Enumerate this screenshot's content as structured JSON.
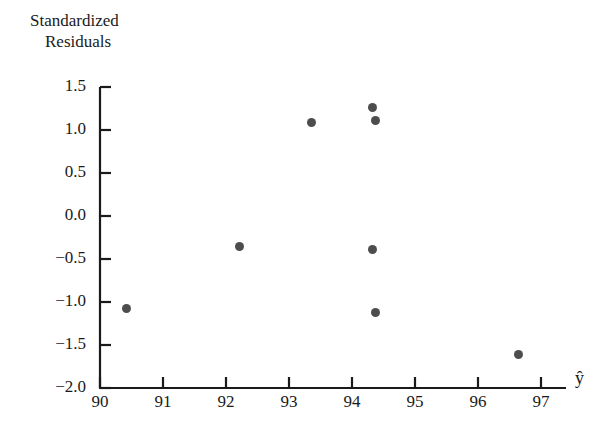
{
  "axis_titles": {
    "y_line1": "Standardized",
    "y_line2": "Residuals",
    "x_label": "ŷ"
  },
  "colors": {
    "marker": "#4d4d4d",
    "axis": "#1a1a1a",
    "text": "#1a1a1a",
    "background": "#ffffff"
  },
  "chart_data": {
    "type": "scatter",
    "title": "",
    "xlabel": "ŷ",
    "ylabel": "Standardized Residuals",
    "xlim": [
      90,
      97.7
    ],
    "ylim": [
      -2.0,
      1.5
    ],
    "grid": false,
    "legend": "none",
    "xticks": [
      90,
      91,
      92,
      93,
      94,
      95,
      96,
      97
    ],
    "xtick_labels": [
      "90",
      "91",
      "92",
      "93",
      "94",
      "95",
      "96",
      "97"
    ],
    "yticks": [
      1.5,
      1.0,
      0.5,
      0.0,
      -0.5,
      -1.0,
      -1.5,
      -2.0
    ],
    "ytick_labels": [
      "1.5",
      "1.0",
      "0.5",
      "0.0",
      "−0.5",
      "−1.0",
      "−1.5",
      "−2.0"
    ],
    "marker_size": 9,
    "points": [
      {
        "x": 90.42,
        "y": -1.08
      },
      {
        "x": 92.22,
        "y": -0.36
      },
      {
        "x": 93.35,
        "y": 1.09
      },
      {
        "x": 94.32,
        "y": 1.26
      },
      {
        "x": 94.38,
        "y": 1.11
      },
      {
        "x": 94.33,
        "y": -0.39
      },
      {
        "x": 94.38,
        "y": -1.12
      },
      {
        "x": 96.65,
        "y": -1.61
      }
    ]
  }
}
